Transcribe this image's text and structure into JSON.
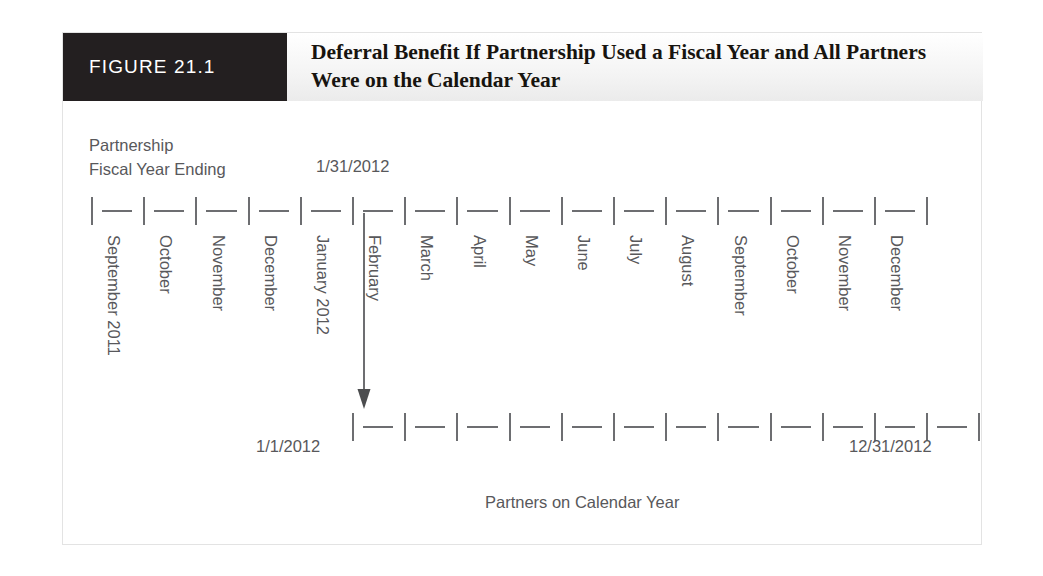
{
  "figure": {
    "badge_label": "FIGURE 21.1",
    "title": "Deferral Benefit If Partnership Used a Fiscal Year and All Partners Were on the Calendar Year"
  },
  "fiscal_year_axis": {
    "label_line1": "Partnership",
    "label_line2": "Fiscal Year Ending",
    "end_date": "1/31/2012",
    "months": [
      "September 2011",
      "October",
      "November",
      "December",
      "January 2012",
      "February",
      "March",
      "April",
      "May",
      "June",
      "July",
      "August",
      "September",
      "October",
      "November",
      "December"
    ],
    "tick_count": 17
  },
  "calendar_year_axis": {
    "start_date": "1/1/2012",
    "end_date": "12/31/2012",
    "footer_label": "Partners on Calendar Year",
    "tick_count": 13
  },
  "annotation": {
    "arrow_name": "deferral-period-arrow",
    "arrow_from_month": "February",
    "arrow_to_month": "1/1/2012"
  },
  "colors": {
    "badge_background": "#231f20",
    "badge_text": "#ffffff",
    "title_text": "#17140f",
    "rule_gray": "#6d6e71",
    "caption_gray": "#58585b",
    "frame_border": "#e3e3e3"
  }
}
